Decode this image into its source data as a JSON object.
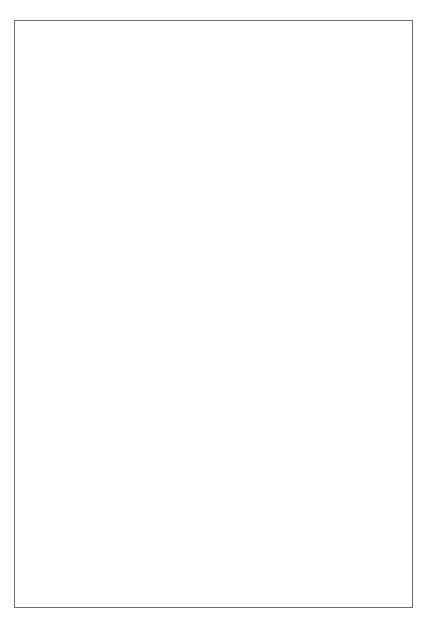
{
  "figure": {
    "background_color": "#ffffff",
    "frame_color": "#6d6d6d",
    "ink_color": "#000000"
  },
  "panels": [
    {
      "id": "top-panel",
      "name": "volume-weighted-distribution"
    },
    {
      "id": "bottom-panel",
      "name": "number-distribution"
    }
  ],
  "chart_data": [
    {
      "type": "bar",
      "id": "top",
      "title": "",
      "xlabel": "Diameter (µm)",
      "ylabel": "10³/µm of Diameter",
      "ylabel_parts": {
        "base": "10",
        "exponent": "3",
        "rest": "/µm of Diameter"
      },
      "xlabel_parts": {
        "text": "Diameter (",
        "unit": "µm",
        "close": ")"
      },
      "xlim": [
        0,
        18
      ],
      "ylim": [
        0,
        9
      ],
      "xticks": [
        0,
        4,
        8,
        12,
        16
      ],
      "xtick_labels": [
        "0",
        "4",
        "8",
        "12",
        "16"
      ],
      "yticks": [
        0,
        2,
        4,
        6,
        8
      ],
      "ytick_labels": [
        "0",
        "2",
        "4",
        "6",
        "8"
      ],
      "x_minor_step": 1,
      "y_minor_step": 0.5,
      "grid": false,
      "legend": null,
      "bin_width": 0.2,
      "bin_edges_start": 0.8,
      "bar_fill": "#ffffff",
      "bar_edge": "#000000",
      "values": [
        0.05,
        0.18,
        0.45,
        0.95,
        1.55,
        2.15,
        2.7,
        3.1,
        3.55,
        3.95,
        4.25,
        4.05,
        4.35,
        3.6,
        3.4,
        3.35,
        2.95,
        2.35,
        1.95,
        1.55,
        1.2,
        0.95,
        0.78,
        0.68,
        0.82,
        0.55,
        0.5,
        0.45,
        0.38,
        0.3,
        0.28,
        0.4,
        0.26,
        0.34,
        0.42,
        0.3,
        0.44,
        0.46,
        0.5,
        0.48,
        0.52,
        0.56,
        0.58,
        0.6,
        0.64,
        0.62,
        0.66,
        0.7,
        0.74,
        0.82,
        0.88,
        1.0,
        0.72,
        0.78,
        0.74,
        0.7,
        0.66,
        0.58,
        0.5,
        0.44,
        0.3,
        0.12,
        0.06,
        0.04,
        0.03,
        0.02,
        0.02,
        0.01,
        0.01,
        0.01,
        0.0,
        0.0,
        0.0,
        0.0,
        0.0,
        0.0,
        0.0,
        0.0,
        0.0,
        0.0,
        0.0,
        0.0,
        0.0,
        0.0,
        0.0,
        0.0
      ]
    },
    {
      "type": "bar",
      "id": "bottom",
      "title": "",
      "xlabel": "Diameter (µm)",
      "ylabel": "Number (10³)",
      "ylabel_parts": {
        "base": "Number (10",
        "exponent": "3",
        "rest": ")"
      },
      "xlabel_parts": {
        "text": "Diameter (",
        "unit": "µm",
        "close": ")"
      },
      "xlim": [
        0,
        2.0
      ],
      "ylim": [
        0,
        6
      ],
      "xticks": [
        0,
        0.5,
        1.0,
        1.5,
        2.0
      ],
      "xtick_labels": [
        "0",
        "0.5",
        "1.0",
        "1.5",
        "2.0"
      ],
      "yticks": [
        0,
        2,
        4,
        6
      ],
      "ytick_labels": [
        "0",
        "2",
        "4",
        "6"
      ],
      "x_minor_step": 0.1,
      "y_minor_step": 0.5,
      "grid": false,
      "legend": null,
      "bin_width": 0.025,
      "bin_edges_start": 0.175,
      "bar_fill": "#ffffff",
      "bar_edge": "#000000",
      "values": [
        0.06,
        0.0,
        0.03,
        0.02,
        0.1,
        0.22,
        0.28,
        0.8,
        0.9,
        1.25,
        1.2,
        0.85,
        0.85,
        1.15,
        1.3,
        1.7,
        2.25,
        2.1,
        2.8,
        2.35,
        2.05,
        2.1,
        2.3,
        1.8,
        1.55,
        1.4,
        1.25,
        1.25,
        0.95,
        1.1,
        1.3,
        1.8,
        1.7,
        1.1,
        1.2,
        0.95,
        0.65,
        0.75,
        0.4,
        0.38,
        0.12,
        0.1,
        0.18,
        0.17,
        0.06,
        0.15,
        0.14,
        0.04,
        0.03,
        0.07,
        0.06,
        0.06,
        0.05,
        0.02,
        0.01,
        0.02,
        0.03,
        0.01,
        0.01,
        0.01,
        0.01,
        0.0,
        0.01,
        0.0,
        0.0,
        0.0,
        0.0,
        0.0,
        0.0,
        0.0,
        0.0,
        0.0
      ]
    }
  ]
}
